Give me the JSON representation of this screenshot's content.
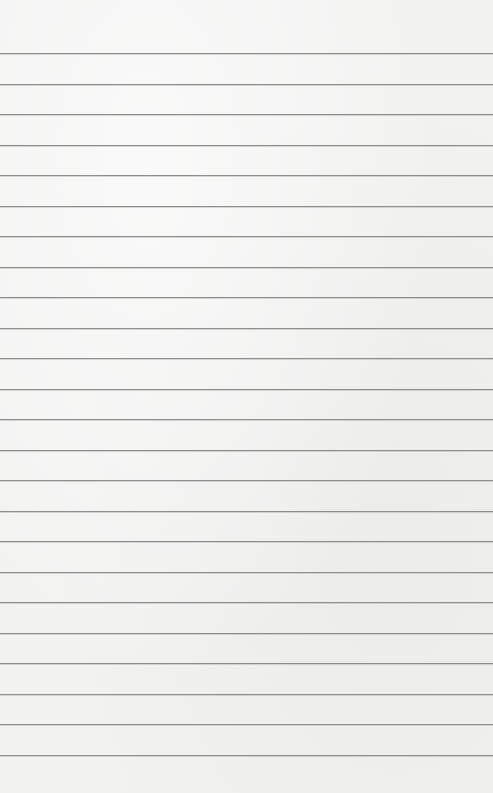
{
  "paper": {
    "type": "lined-paper",
    "background_color": "#f2f2f1",
    "line_color": "#8e8e8c",
    "first_line_y": 53,
    "line_spacing": 30.52,
    "line_count": 24
  }
}
